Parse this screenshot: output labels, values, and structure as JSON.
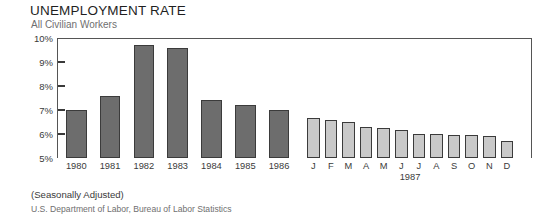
{
  "title": "UNEMPLOYMENT RATE",
  "subtitle": "All Civilian Workers",
  "note": "(Seasonally Adjusted)",
  "source": "U.S. Department of Labor, Bureau of Labor Statistics",
  "period_label": "1987",
  "colors": {
    "annual_bar": "#6d6d6d",
    "monthly_bar": "#c9c9c9",
    "bar_outline": "#3b3b3b",
    "axis": "#555555",
    "text": "#3a3a3a",
    "subtitle_text": "#6f6f6f"
  },
  "chart_data": {
    "type": "bar",
    "title": "UNEMPLOYMENT RATE",
    "subtitle": "All Civilian Workers",
    "xlabel": "",
    "ylabel": "",
    "ylim": [
      5,
      10
    ],
    "yticks": [
      5,
      6,
      7,
      8,
      9,
      10
    ],
    "ytick_labels": [
      "5%",
      "6%",
      "7%",
      "8%",
      "9%",
      "10%"
    ],
    "grid": false,
    "legend": "none",
    "annotations": [
      "(Seasonally Adjusted)",
      "U.S. Department of Labor, Bureau of Labor Statistics"
    ],
    "series": [
      {
        "name": "Annual average unemployment rate",
        "group": "annual",
        "color": "#6d6d6d",
        "categories": [
          "1980",
          "1981",
          "1982",
          "1983",
          "1984",
          "1985",
          "1986"
        ],
        "values": [
          7.0,
          7.6,
          9.7,
          9.6,
          7.4,
          7.2,
          7.0
        ]
      },
      {
        "name": "Monthly unemployment rate 1987",
        "group": "monthly",
        "color": "#c9c9c9",
        "categories": [
          "J",
          "F",
          "M",
          "A",
          "M",
          "J",
          "J",
          "A",
          "S",
          "O",
          "N",
          "D"
        ],
        "values": [
          6.65,
          6.6,
          6.5,
          6.3,
          6.25,
          6.15,
          6.0,
          6.0,
          5.95,
          5.95,
          5.9,
          5.7
        ]
      }
    ]
  }
}
